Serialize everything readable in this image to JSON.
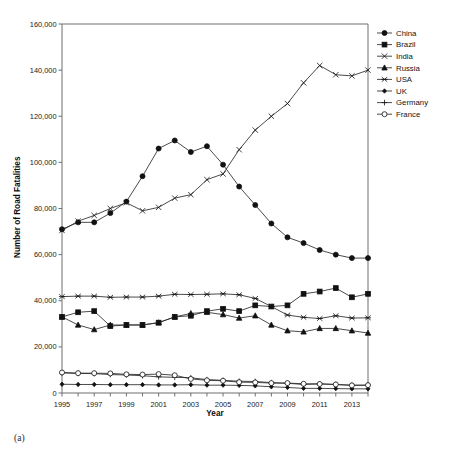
{
  "figure": {
    "caption": "(a)"
  },
  "chart_data": {
    "type": "line",
    "title": "",
    "xlabel": "Year",
    "ylabel": "Number of Road Fatalities",
    "xlim": [
      1995,
      2014
    ],
    "ylim": [
      0,
      160000
    ],
    "ytick_step": 20000,
    "ytick_labels": [
      "0",
      "20,000",
      "40,000",
      "60,000",
      "80,000",
      "100,000",
      "120,000",
      "140,000",
      "160,000"
    ],
    "ytick_values": [
      0,
      20000,
      40000,
      60000,
      80000,
      100000,
      120000,
      140000,
      160000
    ],
    "xtick_labels": [
      "1995",
      "1997",
      "1999",
      "2001",
      "2003",
      "2005",
      "2007",
      "2009",
      "2011",
      "2013"
    ],
    "xtick_values": [
      1995,
      1997,
      1999,
      2001,
      2003,
      2005,
      2007,
      2009,
      2011,
      2013
    ],
    "x": [
      1995,
      1996,
      1997,
      1998,
      1999,
      2000,
      2001,
      2002,
      2003,
      2004,
      2005,
      2006,
      2007,
      2008,
      2009,
      2010,
      2011,
      2012,
      2013,
      2014
    ],
    "grid": false,
    "legend_position": "right",
    "series": [
      {
        "name": "China",
        "marker": "filled-circle",
        "values": [
          71000,
          74000,
          74000,
          78000,
          83000,
          94000,
          106000,
          109500,
          104500,
          107000,
          99000,
          89500,
          81500,
          73500,
          67500,
          65000,
          62000,
          60000,
          58500,
          58500
        ]
      },
      {
        "name": "Brazil",
        "marker": "filled-square",
        "values": [
          33000,
          35000,
          35500,
          29000,
          29500,
          29500,
          30500,
          33000,
          33500,
          35500,
          36500,
          35500,
          38000,
          37500,
          38000,
          43000,
          44000,
          45500,
          41500,
          43000
        ]
      },
      {
        "name": "India",
        "marker": "cross-x",
        "values": [
          70500,
          74500,
          77000,
          80000,
          82500,
          79000,
          80500,
          84500,
          86000,
          92500,
          95000,
          105500,
          114000,
          120000,
          125500,
          134500,
          142000,
          138000,
          137500,
          140000
        ]
      },
      {
        "name": "Russia",
        "marker": "filled-triangle",
        "values": [
          33000,
          29500,
          27500,
          29500,
          29500,
          29500,
          30500,
          33000,
          34500,
          35000,
          34000,
          32500,
          33500,
          29500,
          27000,
          26500,
          28000,
          28000,
          27000,
          26000
        ]
      },
      {
        "name": "USA",
        "marker": "asterisk",
        "values": [
          41800,
          42000,
          42000,
          41500,
          41600,
          41600,
          42000,
          42800,
          42700,
          42800,
          43000,
          42600,
          41000,
          37500,
          33800,
          32800,
          32300,
          33500,
          32500,
          32600
        ]
      },
      {
        "name": "UK",
        "marker": "small-filled-diamond",
        "values": [
          3800,
          3700,
          3700,
          3600,
          3600,
          3600,
          3500,
          3500,
          3600,
          3400,
          3400,
          3300,
          3100,
          2700,
          2400,
          2000,
          2000,
          1900,
          1800,
          1800
        ]
      },
      {
        "name": "Germany",
        "marker": "plus",
        "values": [
          8700,
          8500,
          8400,
          8000,
          7800,
          7500,
          7000,
          6800,
          6600,
          5800,
          5500,
          5100,
          5000,
          4500,
          4200,
          3700,
          4000,
          3700,
          3400,
          3400
        ]
      },
      {
        "name": "France",
        "marker": "open-circle",
        "values": [
          8900,
          8600,
          8600,
          8500,
          8100,
          8000,
          8200,
          7700,
          6100,
          5500,
          5300,
          4700,
          4600,
          4300,
          4300,
          4000,
          3900,
          3700,
          3300,
          3400
        ]
      }
    ]
  }
}
